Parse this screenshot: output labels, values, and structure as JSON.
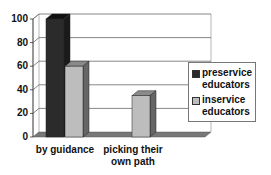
{
  "chart_data": {
    "type": "bar",
    "style": "3d-clustered-column",
    "title": "",
    "xlabel": "",
    "ylabel": "",
    "categories": [
      "by guidance",
      "picking their own path"
    ],
    "category_label_lines": [
      [
        "by guidance"
      ],
      [
        "picking their",
        "own path"
      ]
    ],
    "series": [
      {
        "name": "preservice educators",
        "values": [
          100,
          0
        ],
        "color": "#2b2b2b"
      },
      {
        "name": "inservice educators",
        "values": [
          60,
          35
        ],
        "color": "#bdbdbd"
      }
    ],
    "ylim": [
      0,
      100
    ],
    "yticks": [
      0,
      20,
      40,
      60,
      80,
      100
    ],
    "grid": true,
    "legend_position": "right"
  },
  "legend": {
    "items": [
      {
        "line1": "preservice",
        "line2": "educators"
      },
      {
        "line1": "inservice",
        "line2": "educators"
      }
    ]
  }
}
